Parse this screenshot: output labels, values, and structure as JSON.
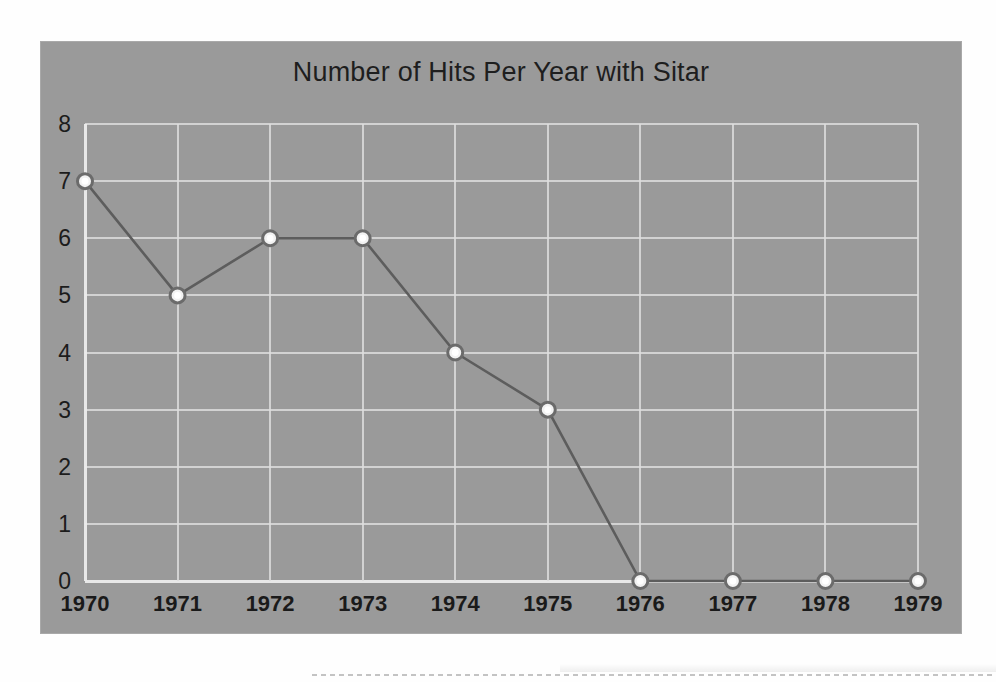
{
  "chart_data": {
    "type": "line",
    "title": "Number of Hits Per Year with Sitar",
    "xlabel": "",
    "ylabel": "",
    "categories": [
      "1970",
      "1971",
      "1972",
      "1973",
      "1974",
      "1975",
      "1976",
      "1977",
      "1978",
      "1979"
    ],
    "values": [
      7,
      5,
      6,
      6,
      4,
      3,
      0,
      0,
      0,
      0
    ],
    "series": [
      {
        "name": "Number of Hits Per Year with Sitar",
        "values": [
          7,
          5,
          6,
          6,
          4,
          3,
          0,
          0,
          0,
          0
        ]
      }
    ],
    "ylim": [
      0,
      8
    ],
    "y_ticks": [
      "0",
      "1",
      "2",
      "3",
      "4",
      "5",
      "6",
      "7",
      "8"
    ],
    "y_tick_step": 1,
    "x_ticks": [
      "1970",
      "1971",
      "1972",
      "1973",
      "1974",
      "1975",
      "1976",
      "1977",
      "1978",
      "1979"
    ],
    "grid": true,
    "legend": false,
    "legend_position": "none",
    "marker": "circle",
    "colors": {
      "plot_background": "#9a9a9a",
      "gridline": "#dedede",
      "axis_line": "#ececec",
      "series_line": "#5d5d5d",
      "marker_fill": "#f2f2f2",
      "marker_stroke": "#6b6b6b",
      "title_text": "#1e1e1e",
      "tick_text": "#1a1a1a",
      "page_background": "#fefefe"
    }
  }
}
